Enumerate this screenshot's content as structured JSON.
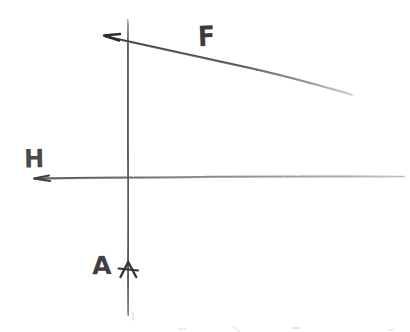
{
  "canvas": {
    "width": 410,
    "height": 332,
    "background_color": "#ffffff",
    "stroke_color": "#4a4a4a",
    "medium": "pencil-sketch"
  },
  "diagram": {
    "title": "",
    "labels": [
      {
        "id": "F",
        "text": "F",
        "x": 210,
        "y": 40,
        "attached_to": "sloped-line"
      },
      {
        "id": "H",
        "text": "H",
        "x": 33,
        "y": 160,
        "attached_to": "horizontal-axis"
      },
      {
        "id": "A",
        "text": "A",
        "x": 103,
        "y": 266,
        "attached_to": "vertical-axis"
      }
    ],
    "strokes": {
      "vertical_axis": {
        "name": "vertical-axis",
        "from": [
          128,
          20
        ],
        "to": [
          128,
          315
        ],
        "arrow": "up",
        "arrow_position": [
          128,
          268
        ]
      },
      "horizontal_axis": {
        "name": "horizontal-axis",
        "from": [
          35,
          178
        ],
        "to": [
          405,
          176
        ],
        "arrow": "left",
        "arrow_position": [
          38,
          178
        ]
      },
      "sloped_line": {
        "name": "sloped-line",
        "from": [
          105,
          36
        ],
        "to": [
          356,
          96
        ],
        "arrow": "left",
        "arrow_position": [
          108,
          37
        ],
        "fades_at": "right-end"
      }
    },
    "intersection": [
      128,
      177
    ]
  }
}
